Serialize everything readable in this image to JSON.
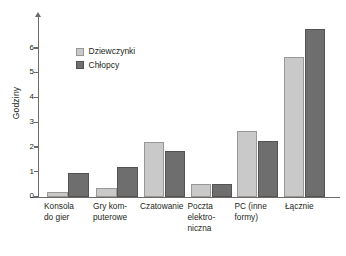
{
  "chart_data": {
    "type": "bar",
    "title": "",
    "xlabel": "",
    "ylabel": "Godziny",
    "ylim": [
      0,
      6.9
    ],
    "ytick_labels": [
      "0",
      "1",
      "2",
      "3",
      "4",
      "5",
      "6"
    ],
    "ytick_values": [
      0,
      1,
      2,
      3,
      4,
      5,
      6
    ],
    "grid": false,
    "legend_position": "upper-left-inside",
    "categories": [
      "Konsola\ndo gier",
      "Gry kom-\nputerowe",
      "Czatowanie",
      "Poczta\nelektro-\nniczna",
      "PC (inne\nformy)",
      "Łącznie"
    ],
    "series": [
      {
        "name": "Dziewczynki",
        "color": "#c9c9c9",
        "values": [
          0.17,
          0.35,
          2.2,
          0.5,
          2.65,
          5.65
        ]
      },
      {
        "name": "Chłopcy",
        "color": "#6e6e6e",
        "values": [
          0.95,
          1.2,
          1.85,
          0.5,
          2.25,
          6.75
        ]
      }
    ]
  },
  "legend": {
    "items": [
      {
        "label": "Dziewczynki",
        "swatch": "light"
      },
      {
        "label": "Chłopcy",
        "swatch": "dark"
      }
    ]
  },
  "axis": {
    "y_title": "Godziny"
  }
}
